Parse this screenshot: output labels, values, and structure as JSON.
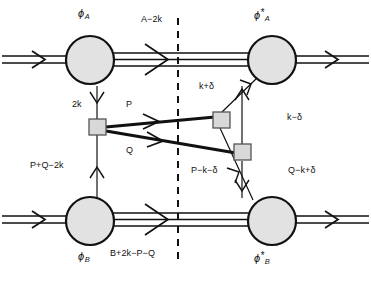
{
  "figure": {
    "type": "feynman-cut-diagram",
    "background": "#ffffff",
    "line_color": "#111111",
    "blob_fill": "#e2e2e2",
    "vertex_fill": "#d8d8d8",
    "cut_line_style": "dashed-vertical"
  },
  "blobs": {
    "top_left": {
      "symbol": "ϕ",
      "star": "",
      "sub": "A"
    },
    "top_right": {
      "symbol": "ϕ",
      "star": "*",
      "sub": "A"
    },
    "bottom_left": {
      "symbol": "ϕ",
      "star": "",
      "sub": "B"
    },
    "bottom_right": {
      "symbol": "ϕ",
      "star": "*",
      "sub": "B"
    }
  },
  "momentum_labels": {
    "top_middle": "A−2k",
    "left_vertical_upper": "2k",
    "bold_upper": "P",
    "bold_lower": "Q",
    "right_upper": "k+δ",
    "right_lower": "k−δ",
    "left_vertical_lower": "P+Q−2k",
    "bottom_middle": "B+2k−P−Q",
    "bottom_right_left": "P−k−δ",
    "bottom_right_right": "Q−k+δ"
  }
}
